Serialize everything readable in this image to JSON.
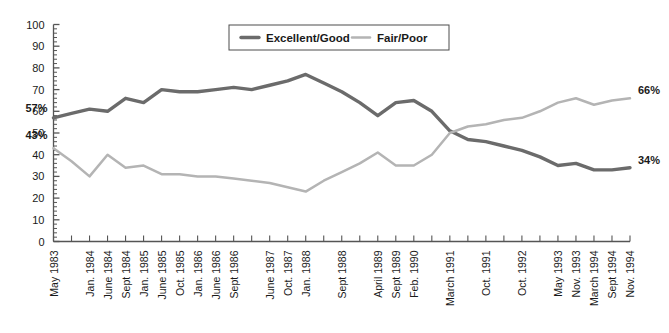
{
  "chart_data": {
    "type": "line",
    "title": "",
    "xlabel": "",
    "ylabel": "",
    "ylim": [
      0,
      100
    ],
    "ytick_step": 10,
    "yticks": [
      "0",
      "10",
      "20",
      "30",
      "40",
      "50",
      "60",
      "70",
      "80",
      "90",
      "100"
    ],
    "grid": false,
    "legend_position": "top-center",
    "legend": [
      "Excellent/Good",
      "Fair/Poor"
    ],
    "colors": {
      "excellent_good": "#6b6b6b",
      "fair_poor": "#b4b4b4",
      "axis": "#555555",
      "text": "#1a1a1a",
      "background": "#ffffff"
    },
    "categories": [
      "May 1983",
      "",
      "Jan. 1984",
      "June 1984",
      "Sept 1984",
      "Jan. 1985",
      "June 1985",
      "Oct. 1985",
      "Jan. 1986",
      "June 1986",
      "Sept 1986",
      "",
      "June 1987",
      "Oct. 1987",
      "Jan. 1988",
      "",
      "Sept 1988",
      "",
      "April 1989",
      "Sept 1989",
      "Feb. 1990",
      "",
      "March 1991",
      "",
      "Oct. 1991",
      "",
      "Oct. 1992",
      "",
      "May 1993",
      "Nov. 1993",
      "March 1994",
      "Sept 1994",
      "Nov. 1994"
    ],
    "series": [
      {
        "name": "Excellent/Good",
        "color": "#6b6b6b",
        "values": [
          57,
          59,
          61,
          60,
          66,
          64,
          70,
          69,
          69,
          70,
          71,
          70,
          72,
          74,
          77,
          73,
          69,
          64,
          58,
          64,
          65,
          60,
          51,
          47,
          46,
          44,
          42,
          39,
          35,
          36,
          33,
          33,
          34
        ]
      },
      {
        "name": "Fair/Poor",
        "color": "#b4b4b4",
        "values": [
          43,
          37,
          30,
          40,
          34,
          35,
          31,
          31,
          30,
          30,
          29,
          28,
          27,
          25,
          23,
          28,
          32,
          36,
          41,
          35,
          35,
          40,
          50,
          53,
          54,
          56,
          57,
          60,
          64,
          66,
          63,
          65,
          66
        ]
      }
    ],
    "annotations": [
      {
        "id": "start-excellent-good",
        "label": "57%",
        "series": "Excellent/Good",
        "at": "May 1983",
        "value": 57
      },
      {
        "id": "start-fair-poor",
        "label": "43%",
        "series": "Fair/Poor",
        "at": "May 1983",
        "value": 43
      },
      {
        "id": "end-fair-poor",
        "label": "66%",
        "series": "Fair/Poor",
        "at": "Nov. 1994",
        "value": 66
      },
      {
        "id": "end-excellent-good",
        "label": "34%",
        "series": "Excellent/Good",
        "at": "Nov. 1994",
        "value": 34
      }
    ]
  }
}
